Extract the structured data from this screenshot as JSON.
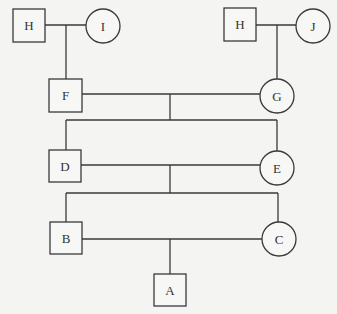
{
  "diagram": {
    "type": "pedigree",
    "legend": {
      "square": "male",
      "circle": "female"
    },
    "nodes": [
      {
        "id": "H1",
        "label": "H",
        "shape": "square",
        "generation": 1
      },
      {
        "id": "I",
        "label": "I",
        "shape": "circle",
        "generation": 1
      },
      {
        "id": "H2",
        "label": "H",
        "shape": "square",
        "generation": 1
      },
      {
        "id": "J",
        "label": "J",
        "shape": "circle",
        "generation": 1
      },
      {
        "id": "F",
        "label": "F",
        "shape": "square",
        "generation": 2
      },
      {
        "id": "G",
        "label": "G",
        "shape": "circle",
        "generation": 2
      },
      {
        "id": "D",
        "label": "D",
        "shape": "square",
        "generation": 3
      },
      {
        "id": "E",
        "label": "E",
        "shape": "circle",
        "generation": 3
      },
      {
        "id": "B",
        "label": "B",
        "shape": "square",
        "generation": 4
      },
      {
        "id": "C",
        "label": "C",
        "shape": "circle",
        "generation": 4
      },
      {
        "id": "A",
        "label": "A",
        "shape": "square",
        "generation": 5
      }
    ],
    "matings": [
      {
        "parents": [
          "H1",
          "I"
        ],
        "children": [
          "F"
        ]
      },
      {
        "parents": [
          "H2",
          "J"
        ],
        "children": [
          "G"
        ]
      },
      {
        "parents": [
          "F",
          "G"
        ],
        "children": [
          "D",
          "E"
        ]
      },
      {
        "parents": [
          "D",
          "E"
        ],
        "children": [
          "B",
          "C"
        ]
      },
      {
        "parents": [
          "B",
          "C"
        ],
        "children": [
          "A"
        ]
      }
    ]
  }
}
